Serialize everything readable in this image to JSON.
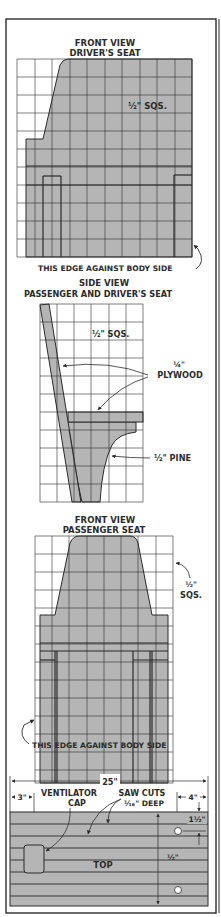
{
  "colors": {
    "ink": "#2b2b2b",
    "fill": "#b5b5b5",
    "paper": "#ffffff"
  },
  "front_view_driver": {
    "title_line1": "FRONT VIEW",
    "title_line2": "DRIVER'S SEAT",
    "scale_label": "½\" SQS.",
    "edge_note": "THIS EDGE AGAINST BODY SIDE"
  },
  "side_view": {
    "title_line1": "SIDE VIEW",
    "title_line2": "PASSENGER AND DRIVER'S SEAT",
    "scale_label": "½\" SQS.",
    "plywood_thickness": "¼\"",
    "plywood_label": "PLYWOOD",
    "pine_label": "½\" PINE"
  },
  "front_view_passenger": {
    "title_line1": "FRONT VIEW",
    "title_line2": "PASSENGER SEAT",
    "scale_label_line1": "½\"",
    "scale_label_line2": "SQS.",
    "edge_note": "THIS EDGE AGAINST BODY SIDE"
  },
  "top_view": {
    "overall_width": "25\"",
    "left_offset": "3\"",
    "right_offset": "4\"",
    "ventilator_label_line1": "VENTILATOR",
    "ventilator_label_line2": "CAP",
    "saw_cuts_line1": "SAW CUTS",
    "saw_cuts_line2": "¹⁄₁₆\" DEEP",
    "hole_offset": "1½\"",
    "board_depth": "½\"",
    "top_label": "TOP"
  }
}
